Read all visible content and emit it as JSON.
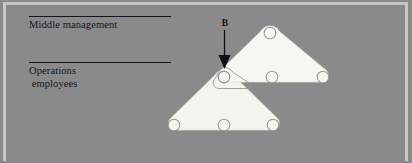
{
  "figure": {
    "width": 412,
    "height": 163,
    "background_color": "#8a8a8a",
    "border_color": "#c9c9c9",
    "title": ""
  },
  "labels": {
    "middle_management": "Middle management",
    "operations_employees_line1": "Operations",
    "operations_employees_line2": " employees"
  },
  "annotation": {
    "arrow_label": "B",
    "arrow_color": "#101014",
    "arrow_target": "shared-node"
  },
  "diagram": {
    "shape_fill": "#f4f4ee",
    "shape_stroke": "#d9d9d2",
    "node_stroke": "#8f8f8f",
    "node_fill": "#f4f4ee",
    "node_radius": 6.0,
    "groups": [
      {
        "name": "middle-management-team",
        "kind": "triangle",
        "nodes": [
          {
            "id": "mm-apex",
            "x": 270,
            "y": 33
          },
          {
            "id": "mm-right",
            "x": 323,
            "y": 77
          },
          {
            "id": "shared-node",
            "x": 224,
            "y": 77
          }
        ],
        "interior_nodes": [
          {
            "id": "mm-center",
            "x": 272,
            "y": 77
          }
        ]
      },
      {
        "name": "operations-team",
        "kind": "triangle",
        "nodes": [
          {
            "id": "shared-node",
            "x": 224,
            "y": 77
          },
          {
            "id": "op-right",
            "x": 273,
            "y": 125
          },
          {
            "id": "op-left",
            "x": 174,
            "y": 125
          }
        ],
        "interior_nodes": [
          {
            "id": "op-center",
            "x": 224,
            "y": 125
          }
        ]
      }
    ],
    "highlight": {
      "name": "boundary-spanner-outline",
      "around_node": "shared-node",
      "stroke": "#9a9a93"
    }
  }
}
